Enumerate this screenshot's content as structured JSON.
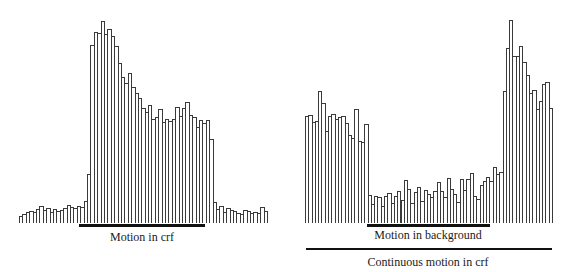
{
  "chart_data": [
    {
      "type": "bar",
      "title": "",
      "xlabel": "",
      "ylabel": "",
      "description": "Peristimulus time histogram: response to motion in the classical receptive field (crf)",
      "stimulus_bars": [
        {
          "label": "Motion in crf",
          "start_bin": 18,
          "end_bin": 56
        }
      ],
      "values": [
        7,
        9,
        11,
        12,
        11,
        14,
        17,
        13,
        15,
        11,
        14,
        12,
        13,
        15,
        18,
        16,
        15,
        17,
        16,
        22,
        49,
        178,
        191,
        190,
        202,
        189,
        194,
        187,
        177,
        160,
        146,
        140,
        150,
        136,
        130,
        125,
        115,
        111,
        118,
        104,
        106,
        114,
        101,
        104,
        102,
        104,
        116,
        107,
        115,
        121,
        108,
        106,
        96,
        103,
        100,
        103,
        84,
        21,
        14,
        17,
        11,
        15,
        13,
        12,
        10,
        9,
        13,
        12,
        10,
        11,
        10,
        16,
        12
      ]
    },
    {
      "type": "bar",
      "title": "",
      "xlabel": "",
      "ylabel": "",
      "description": "Peristimulus time histogram: continuous motion in crf with additional motion in the background",
      "stimulus_bars": [
        {
          "label": "Motion in background",
          "start_bin": 20,
          "end_bin": 57
        },
        {
          "label": "Continuous motion in crf",
          "start_bin": 0,
          "end_bin": 74
        }
      ],
      "values": [
        107,
        108,
        101,
        102,
        132,
        120,
        92,
        107,
        109,
        104,
        106,
        107,
        100,
        88,
        85,
        114,
        82,
        81,
        99,
        28,
        19,
        27,
        26,
        17,
        27,
        30,
        20,
        27,
        32,
        23,
        43,
        34,
        20,
        31,
        36,
        22,
        33,
        29,
        26,
        32,
        41,
        32,
        26,
        45,
        34,
        29,
        21,
        44,
        33,
        44,
        50,
        27,
        24,
        38,
        42,
        46,
        42,
        56,
        49,
        51,
        132,
        175,
        203,
        167,
        167,
        177,
        161,
        148,
        130,
        133,
        114,
        122,
        139,
        141,
        115
      ]
    }
  ],
  "labels": {
    "left_stimulus": "Motion in crf",
    "right_background": "Motion in background",
    "right_continuous": "Continuous motion in crf"
  }
}
